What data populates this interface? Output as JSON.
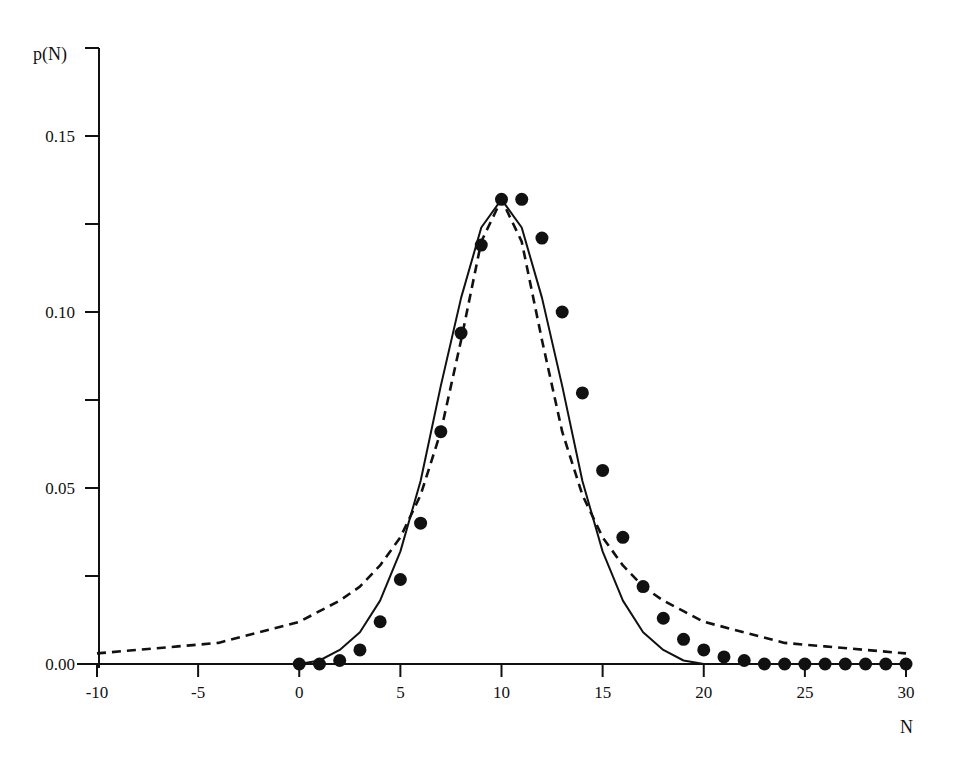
{
  "chart_data": {
    "type": "line",
    "title": "",
    "xlabel": "N",
    "ylabel": "p(N)",
    "xlim": [
      -10,
      30
    ],
    "ylim": [
      0,
      0.175
    ],
    "grid": false,
    "legend": "none",
    "x_ticks": [
      -10,
      -5,
      0,
      5,
      10,
      15,
      20,
      25,
      30
    ],
    "x_tick_labels": [
      "-10",
      "-5",
      "0",
      "5",
      "10",
      "15",
      "20",
      "25",
      "30"
    ],
    "y_ticks": [
      0,
      0.025,
      0.05,
      0.075,
      0.1,
      0.125,
      0.15,
      0.175
    ],
    "y_tick_labels": [
      "0.00",
      "",
      "0.05",
      "",
      "0.10",
      "",
      "0.15",
      ""
    ],
    "series": [
      {
        "name": "data-points",
        "style": "filled-circles",
        "x": [
          0,
          1,
          2,
          3,
          4,
          5,
          6,
          7,
          8,
          9,
          10,
          11,
          12,
          13,
          14,
          15,
          16,
          17,
          18,
          19,
          20,
          21,
          22,
          23,
          24,
          25,
          26,
          27,
          28,
          29,
          30
        ],
        "values": [
          0.0,
          0.0,
          0.001,
          0.004,
          0.012,
          0.024,
          0.04,
          0.066,
          0.094,
          0.119,
          0.132,
          0.132,
          0.121,
          0.1,
          0.077,
          0.055,
          0.036,
          0.022,
          0.013,
          0.007,
          0.004,
          0.002,
          0.001,
          0.0,
          0.0,
          0.0,
          0.0,
          0.0,
          0.0,
          0.0,
          0.0
        ]
      },
      {
        "name": "solid-curve",
        "style": "solid",
        "x": [
          0,
          1,
          2,
          3,
          4,
          5,
          6,
          7,
          8,
          9,
          10,
          11,
          12,
          13,
          14,
          15,
          16,
          17,
          18,
          19,
          20,
          21,
          22,
          23,
          24,
          25,
          26,
          27,
          28,
          29,
          30
        ],
        "values": [
          0.0,
          0.001,
          0.004,
          0.009,
          0.018,
          0.032,
          0.052,
          0.079,
          0.104,
          0.124,
          0.132,
          0.124,
          0.104,
          0.079,
          0.052,
          0.032,
          0.018,
          0.009,
          0.004,
          0.001,
          0.0,
          0.0,
          0.0,
          0.0,
          0.0,
          0.0,
          0.0,
          0.0,
          0.0,
          0.0,
          0.0
        ]
      },
      {
        "name": "dashed-curve",
        "style": "dashed",
        "x": [
          -10,
          -8,
          -6,
          -4,
          -2,
          0,
          1,
          2,
          3,
          4,
          5,
          6,
          7,
          8,
          9,
          10,
          11,
          12,
          13,
          14,
          15,
          16,
          17,
          18,
          19,
          20,
          22,
          24,
          26,
          28,
          30
        ],
        "values": [
          0.003,
          0.004,
          0.005,
          0.006,
          0.009,
          0.012,
          0.015,
          0.018,
          0.022,
          0.028,
          0.036,
          0.048,
          0.066,
          0.092,
          0.12,
          0.132,
          0.12,
          0.092,
          0.066,
          0.048,
          0.036,
          0.028,
          0.022,
          0.018,
          0.015,
          0.012,
          0.009,
          0.006,
          0.005,
          0.004,
          0.003
        ]
      }
    ]
  }
}
